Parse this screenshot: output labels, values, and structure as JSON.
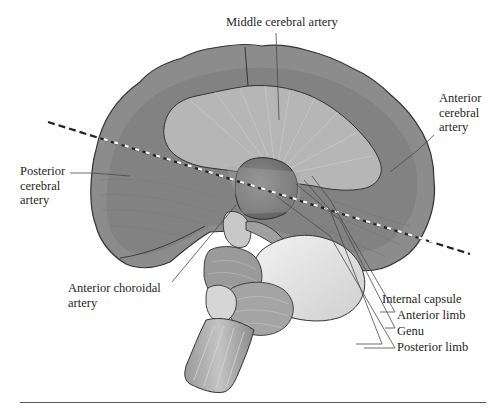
{
  "figure": {
    "type": "anatomical-diagram",
    "labels": {
      "middle_cerebral_artery": "Middle cerebral artery",
      "anterior_cerebral_artery": [
        "Anterior",
        "cerebral",
        "artery"
      ],
      "posterior_cerebral_artery": [
        "Posterior",
        "cerebral",
        "artery"
      ],
      "anterior_choroidal_artery": [
        "Anterior choroidal",
        "artery"
      ],
      "internal_capsule": "Internal capsule",
      "anterior_limb": "Anterior limb",
      "genu": "Genu",
      "posterior_limb": "Posterior limb"
    },
    "annotations": {
      "section_line": "dashed oblique line across hemisphere"
    },
    "colors": {
      "cortex": "#8a8a8a",
      "cortex_dark": "#6e6e6e",
      "white_matter": "#b4b4b4",
      "thalamus": "#7a7a7a",
      "pons": "#e2e2e2",
      "outline": "#333333",
      "leader": "#4a4a4a"
    }
  }
}
